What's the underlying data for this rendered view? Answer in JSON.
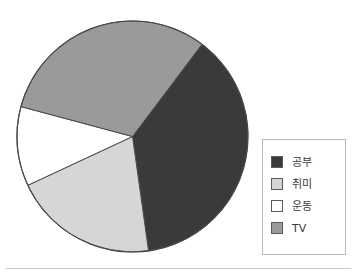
{
  "chart_data": {
    "type": "pie",
    "title": "",
    "xlabel": "",
    "ylabel": "",
    "legend_position": "right",
    "grid": false,
    "categories": [
      "공부",
      "취미",
      "운동",
      "TV"
    ],
    "values": [
      37,
      20,
      11,
      32
    ],
    "units": "percent",
    "slices": [
      {
        "label": "공부",
        "value": 37,
        "color": "#3a3a3a",
        "start_deg": 37,
        "end_deg": 172
      },
      {
        "label": "취미",
        "value": 20,
        "color": "#d6d6d6",
        "start_deg": 172,
        "end_deg": 245
      },
      {
        "label": "운동",
        "value": 11,
        "color": "#ffffff",
        "start_deg": 245,
        "end_deg": 285
      },
      {
        "label": "TV",
        "value": 32,
        "color": "#9a9a9a",
        "start_deg": 285,
        "end_deg": 397
      }
    ],
    "colors": {
      "study": "#3a3a3a",
      "hobby": "#d6d6d6",
      "exercise": "#ffffff",
      "tv": "#9a9a9a",
      "outline": "#4a4a4a",
      "legend_border": "#b9b9b9",
      "rule": "#c9c9c9"
    }
  },
  "legend": {
    "items": [
      {
        "label": "공부",
        "color": "#3a3a3a"
      },
      {
        "label": "취미",
        "color": "#d6d6d6"
      },
      {
        "label": "운동",
        "color": "#ffffff"
      },
      {
        "label": "TV",
        "color": "#9a9a9a"
      }
    ]
  }
}
